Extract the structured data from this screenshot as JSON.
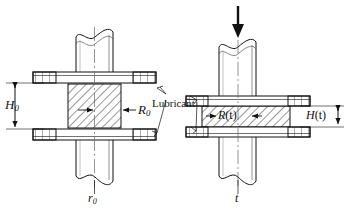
{
  "figure": {
    "background": "#ffffff",
    "line_color": "#111111",
    "hatch_color": "#333333"
  },
  "labels": {
    "h0": "H",
    "h0_sub": "0",
    "r0_cap": "R",
    "r0_cap_sub": "0",
    "r0_low": "r",
    "r0_low_sub": "0",
    "lubricant": "Lubricant",
    "h_t": "H",
    "h_t_arg": "(t)",
    "r_t_cap": "R",
    "r_t_cap_arg": "(t)",
    "t_low": "t"
  },
  "annotations": {
    "force_arrow": "downward-force-arrow",
    "left_state": "initial-state",
    "right_state": "time-t-state"
  }
}
